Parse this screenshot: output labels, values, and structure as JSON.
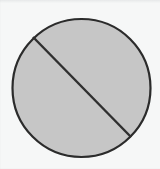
{
  "figure": {
    "canvas": {
      "width": 160,
      "height": 169
    },
    "background_color": "#f6f7f7",
    "shapes": {
      "circle": {
        "label": "circle",
        "center_x": 81.5,
        "center_y": 88,
        "radius": 69,
        "fill_color": "#c6c6c6",
        "stroke_color": "#2b2b2b",
        "stroke_width": 2.2
      },
      "chord": {
        "label": "diagonal chord",
        "x1": 33,
        "y1": 37,
        "x2": 131,
        "y2": 137,
        "stroke_color": "#2f2f2f",
        "stroke_width": 2.4
      }
    }
  }
}
